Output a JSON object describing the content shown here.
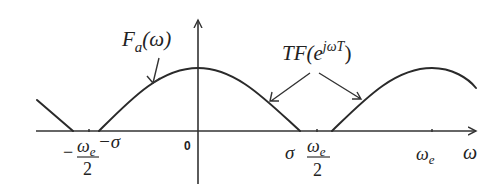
{
  "diagram": {
    "labels": {
      "fa": {
        "main": "F",
        "sub": "a",
        "arg": "(ω)"
      },
      "tf": {
        "main": "TF(e",
        "sup": "jωT",
        "close": ")"
      }
    },
    "axis": {
      "x_label": "ω",
      "origin": "0"
    },
    "ticks": {
      "neg_half_num": "ω",
      "neg_half_sub": "e",
      "neg_half_den": "2",
      "neg_half_sign": "−",
      "neg_sigma": "−σ",
      "pos_sigma": "σ",
      "pos_half_num": "ω",
      "pos_half_sub": "e",
      "pos_half_den": "2",
      "omega_e": "ω",
      "omega_e_sub": "e"
    }
  }
}
